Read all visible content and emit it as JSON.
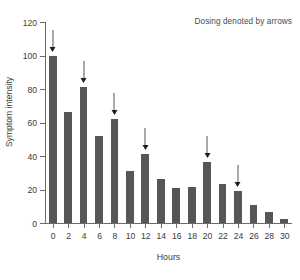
{
  "chart_data": {
    "type": "bar",
    "title": "",
    "xlabel": "Hours",
    "ylabel": "Symptom intensity",
    "categories": [
      "0",
      "2",
      "4",
      "6",
      "8",
      "10",
      "12",
      "14",
      "16",
      "18",
      "20",
      "22",
      "24",
      "26",
      "28",
      "30"
    ],
    "values": [
      100,
      66,
      81,
      52,
      62,
      31,
      41,
      26,
      21,
      21.5,
      36.5,
      23.5,
      19,
      11,
      6.5,
      2.5
    ],
    "ylim": [
      0,
      120
    ],
    "yticks": [
      0,
      20,
      40,
      60,
      80,
      100,
      120
    ],
    "ytick_labels": [
      "0",
      "20",
      "40",
      "60",
      "80",
      "100",
      "120"
    ],
    "xlim": [
      -1,
      31
    ],
    "grid": false,
    "legend": null,
    "bar_color": "#565656",
    "axis_color": "#6b6b6b",
    "annotation": "Dosing denoted by arrows",
    "annotations": [
      {
        "label": "dose",
        "category": "0",
        "value": 100
      },
      {
        "label": "dose",
        "category": "4",
        "value": 81
      },
      {
        "label": "dose",
        "category": "8",
        "value": 62
      },
      {
        "label": "dose",
        "category": "12",
        "value": 41
      },
      {
        "label": "dose",
        "category": "20",
        "value": 36.5
      },
      {
        "label": "dose",
        "category": "24",
        "value": 19
      }
    ]
  }
}
